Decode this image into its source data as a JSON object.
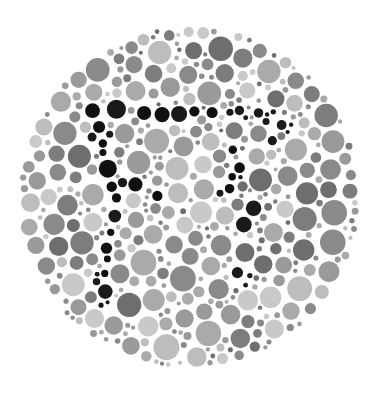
{
  "image": {
    "kind": "ishihara-color-vision-test-plate",
    "title": "Ishihara Test Plate",
    "width": 381,
    "height": 393,
    "background_color": "#ffffff",
    "rendering": "grayscale"
  },
  "plate": {
    "center_x": 189,
    "center_y": 197,
    "radius": 172,
    "mosaic_description": "Dense mosaic of non-overlapping circular dots of varying diameter filling a circular field.",
    "hidden_figure_present": true,
    "hidden_figure_note": "Near-black dots form the embedded figure against mid-gray background dots."
  },
  "palette": {
    "background": "#ffffff",
    "dot_light": "#c9c9c9",
    "dot_light_alt": "#bdbdbd",
    "dot_mid_light": "#aaaaaa",
    "dot_mid": "#9a9a9a",
    "dot_mid_dark": "#8a8a8a",
    "dot_gray": "#7d7d7d",
    "dot_dark_gray": "#6e6e6e",
    "figure_black": "#1a1a1a",
    "figure_black_alt": "#101010"
  },
  "dot_sizes": {
    "min_radius": 2,
    "max_radius": 13,
    "typical_radius": 7
  },
  "chart_data": {
    "type": "scatter",
    "xlabel": "",
    "ylabel": "",
    "xlim": [
      0,
      381
    ],
    "ylim": [
      0,
      393
    ],
    "grid": false,
    "legend": "none",
    "series": [
      {
        "name": "background-dots",
        "color": "#9a9a9a",
        "count_approx": 760
      },
      {
        "name": "figure-dots",
        "color": "#1a1a1a",
        "count_approx": 52
      }
    ]
  }
}
